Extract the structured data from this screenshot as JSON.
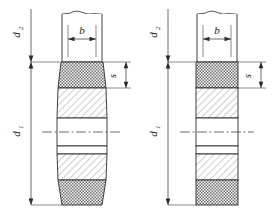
{
  "drawing": {
    "title": "Technical drawing - two shaft / roller sections with dimension callouts",
    "background_color": "#ffffff",
    "line_color": "#2b2b2b",
    "hatch_color": "#555555",
    "figures": [
      {
        "id": "left-figure",
        "shape": "tapered-barrel",
        "dimensions": [
          {
            "name": "d2",
            "label": "d",
            "subscript": "2",
            "orientation": "vertical",
            "side": "left",
            "position": "upper"
          },
          {
            "name": "d1",
            "label": "d",
            "subscript": "1",
            "orientation": "vertical",
            "side": "left",
            "position": "lower"
          },
          {
            "name": "b",
            "label": "b",
            "subscript": "",
            "orientation": "horizontal",
            "side": "top",
            "position": "neck"
          },
          {
            "name": "s",
            "label": "s",
            "subscript": "",
            "orientation": "vertical",
            "side": "right",
            "position": "upper-band"
          }
        ],
        "bands": [
          {
            "index": 0,
            "pattern": "cross-hatch-knurl"
          },
          {
            "index": 1,
            "pattern": "diagonal-hatch"
          },
          {
            "index": 2,
            "pattern": "blank"
          },
          {
            "index": 3,
            "pattern": "blank-thin"
          },
          {
            "index": 4,
            "pattern": "diagonal-hatch"
          },
          {
            "index": 5,
            "pattern": "cross-hatch-knurl"
          }
        ],
        "features": [
          "wavy-break-line-top",
          "center-line"
        ]
      },
      {
        "id": "right-figure",
        "shape": "straight-cylinder",
        "dimensions": [
          {
            "name": "d2",
            "label": "d",
            "subscript": "2",
            "orientation": "vertical",
            "side": "left",
            "position": "upper"
          },
          {
            "name": "d1",
            "label": "d",
            "subscript": "1",
            "orientation": "vertical",
            "side": "left",
            "position": "lower"
          },
          {
            "name": "b",
            "label": "b",
            "subscript": "",
            "orientation": "horizontal",
            "side": "top",
            "position": "neck"
          },
          {
            "name": "s",
            "label": "s",
            "subscript": "",
            "orientation": "vertical",
            "side": "right",
            "position": "upper-band"
          }
        ],
        "bands": [
          {
            "index": 0,
            "pattern": "cross-hatch-knurl"
          },
          {
            "index": 1,
            "pattern": "diagonal-hatch"
          },
          {
            "index": 2,
            "pattern": "blank"
          },
          {
            "index": 3,
            "pattern": "blank-thin"
          },
          {
            "index": 4,
            "pattern": "diagonal-hatch"
          },
          {
            "index": 5,
            "pattern": "cross-hatch-knurl"
          }
        ],
        "features": [
          "wavy-break-line-top",
          "center-line"
        ]
      }
    ],
    "labels": {
      "d_letter": "d",
      "sub_2": "2",
      "sub_1": "1",
      "b_letter": "b",
      "s_letter": "s"
    }
  }
}
